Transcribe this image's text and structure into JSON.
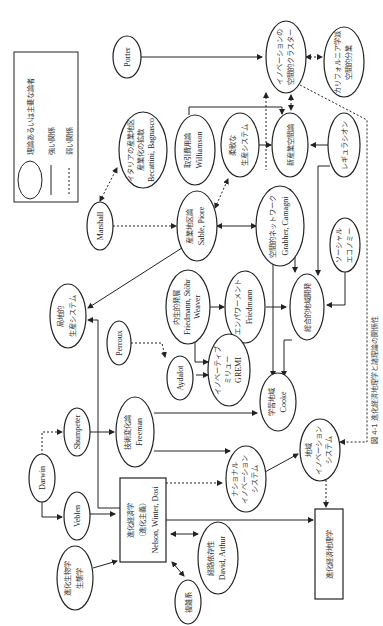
{
  "caption": "図 4-1 進化経済地理学と諸理論の関係性",
  "legend": {
    "theory_label": "理論あるいは主要な論者",
    "strong_label": "強い関係",
    "weak_label": "弱い関係"
  },
  "nodes": {
    "porter": {
      "l1": "Porter"
    },
    "innovation_cluster": {
      "l1": "イノベーションの",
      "l2": "空間的クラスター"
    },
    "california": {
      "l1": "カリフォルニア学派",
      "l2": "空間的分業"
    },
    "italy": {
      "l1": "イタリアの産業地区",
      "l2": "産業化の拡散",
      "l3": "Becattini, Bagnasco"
    },
    "transaction": {
      "l1": "取引費用論",
      "l2": "Williamson"
    },
    "flexible": {
      "l1": "柔軟な",
      "l2": "生産システム"
    },
    "new_industrial": {
      "l1": "新産業空間論"
    },
    "regulation": {
      "l1": "レギュラシオン"
    },
    "marshall": {
      "l1": "Marshall"
    },
    "industrial_district": {
      "l1": "産業地区論",
      "l2": "Sable, Piore"
    },
    "spatial_network": {
      "l1": "空間的ネットワーク",
      "l2": "Grabher, Camagni"
    },
    "social_economy": {
      "l1": "ソーシャル",
      "l2": "エコノミー"
    },
    "local_production": {
      "l1": "局地的",
      "l2": "生産システム"
    },
    "endogenous": {
      "l1": "内生的発展",
      "l2": "Friedmann, Stöhr",
      "l3": "Weaver"
    },
    "empowerment": {
      "l1": "エンパワーメント",
      "l2": "Friedmann"
    },
    "integrated": {
      "l1": "総合的地域開発"
    },
    "perroux": {
      "l1": "Perroux"
    },
    "aydalot": {
      "l1": "Aydalot"
    },
    "milieu": {
      "l1": "イノベーティブ",
      "l2": "ミリュー",
      "l3": "GREMI"
    },
    "learning_region": {
      "l1": "学習地域",
      "l2": "Cooke"
    },
    "darwin": {
      "l1": "Darwin"
    },
    "shumpeter": {
      "l1": "Shumpeter"
    },
    "veblen": {
      "l1": "Veblen"
    },
    "tech_change": {
      "l1": "技術変化論",
      "l2": "Freeman"
    },
    "national_is": {
      "l1": "ナショナル",
      "l2": "イノベーション",
      "l3": "システム"
    },
    "regional_is": {
      "l1": "地域",
      "l2": "イノベーション",
      "l3": "システム"
    },
    "evo_econ": {
      "l1": "進化経済学",
      "l2": "（進化主義）",
      "l3": "Nelson, Winter, Dosi"
    },
    "evo_biology": {
      "l1": "進化生物学",
      "l2": "生態学"
    },
    "path_dependence": {
      "l1": "経路依存性",
      "l2": "David, Arthur"
    },
    "complex": {
      "l1": "複雑系"
    },
    "evo_econ_geo": {
      "l1": "進化経済地理学"
    }
  }
}
